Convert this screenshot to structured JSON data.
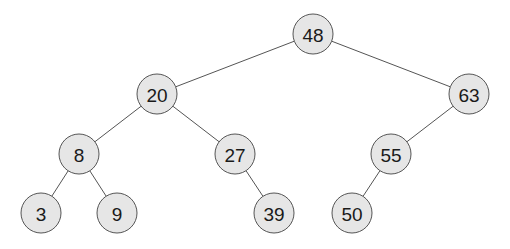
{
  "diagram": {
    "type": "binary-search-tree",
    "colors": {
      "node_fill": "#e6e6e6",
      "node_stroke": "#555555",
      "edge": "#555555",
      "text": "#1a1a1a"
    },
    "nodes": [
      {
        "id": "n48",
        "label": "48",
        "x": 313,
        "y": 34
      },
      {
        "id": "n20",
        "label": "20",
        "x": 157,
        "y": 94
      },
      {
        "id": "n63",
        "label": "63",
        "x": 469,
        "y": 94
      },
      {
        "id": "n8",
        "label": "8",
        "x": 79,
        "y": 154
      },
      {
        "id": "n27",
        "label": "27",
        "x": 235,
        "y": 154
      },
      {
        "id": "n55",
        "label": "55",
        "x": 391,
        "y": 154
      },
      {
        "id": "n3",
        "label": "3",
        "x": 41,
        "y": 213
      },
      {
        "id": "n9",
        "label": "9",
        "x": 117,
        "y": 213
      },
      {
        "id": "n39",
        "label": "39",
        "x": 274,
        "y": 213
      },
      {
        "id": "n50",
        "label": "50",
        "x": 352,
        "y": 213
      }
    ],
    "edges": [
      {
        "from": "48",
        "to": "20"
      },
      {
        "from": "48",
        "to": "63"
      },
      {
        "from": "20",
        "to": "8"
      },
      {
        "from": "20",
        "to": "27"
      },
      {
        "from": "63",
        "to": "55"
      },
      {
        "from": "8",
        "to": "3"
      },
      {
        "from": "8",
        "to": "9"
      },
      {
        "from": "27",
        "to": "39"
      },
      {
        "from": "55",
        "to": "50"
      }
    ]
  }
}
